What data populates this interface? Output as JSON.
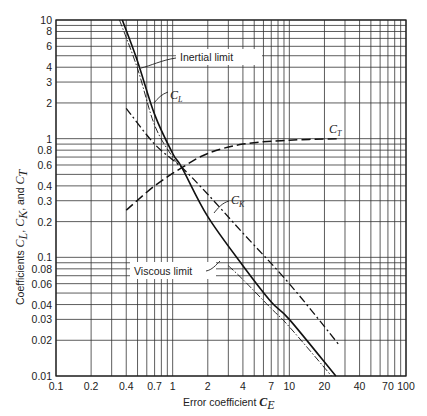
{
  "chart_data": {
    "type": "line",
    "title": "",
    "xlabel": "Error coefficient C_E",
    "ylabel": "Coefficients C_L, C_K, and C_T",
    "xscale": "log",
    "yscale": "log",
    "xlim": [
      0.1,
      100
    ],
    "ylim": [
      0.01,
      10
    ],
    "grid": true,
    "x_ticks": [
      "0.1",
      "0.2",
      "0.4",
      "0.7",
      "1",
      "2",
      "4",
      "7",
      "10",
      "20",
      "40",
      "70",
      "100"
    ],
    "y_ticks": [
      "0.01",
      "0.02",
      "0.03",
      "0.04",
      "0.06",
      "0.08",
      "0.1",
      "0.2",
      "0.3",
      "0.4",
      "0.6",
      "0.8",
      "1",
      "2",
      "3",
      "4",
      "6",
      "8",
      "10"
    ],
    "series": [
      {
        "name": "C_L",
        "style": "solid",
        "x": [
          0.37,
          0.5,
          0.7,
          1.0,
          1.2,
          2,
          4,
          7,
          10,
          25
        ],
        "y": [
          10,
          4.5,
          1.6,
          0.75,
          0.57,
          0.22,
          0.085,
          0.042,
          0.03,
          0.01
        ]
      },
      {
        "name": "Inertial limit",
        "style": "dash-dot-thin",
        "x": [
          0.35,
          0.5,
          0.7,
          1.0,
          1.2
        ],
        "y": [
          10,
          3.9,
          1.3,
          0.7,
          0.57
        ]
      },
      {
        "name": "Viscous limit",
        "style": "dash-dot-thin",
        "x": [
          3.0,
          4,
          7,
          10,
          23
        ],
        "y": [
          0.085,
          0.065,
          0.037,
          0.026,
          0.01
        ]
      },
      {
        "name": "C_K",
        "style": "dash-dot",
        "x": [
          0.4,
          0.7,
          1.2,
          2,
          4,
          10,
          27
        ],
        "y": [
          1.8,
          0.9,
          0.57,
          0.34,
          0.16,
          0.06,
          0.018
        ]
      },
      {
        "name": "C_T",
        "style": "dashed",
        "x": [
          0.4,
          0.7,
          1.2,
          2,
          4,
          10,
          27
        ],
        "y": [
          0.25,
          0.4,
          0.57,
          0.75,
          0.9,
          0.97,
          1.0
        ]
      }
    ],
    "annotations": [
      {
        "text": "Inertial limit"
      },
      {
        "text": "C_L"
      },
      {
        "text": "C_T"
      },
      {
        "text": "C_K"
      },
      {
        "text": "Viscous limit"
      }
    ]
  },
  "labels": {
    "x_axis_main": "Error coefficient ",
    "x_axis_sym": "C",
    "x_axis_sub": "E",
    "y_axis_main": "Coefficients ",
    "y_axis_cl": "C",
    "y_axis_cl_sub": "L",
    "y_axis_sep1": ", ",
    "y_axis_ck": "C",
    "y_axis_ck_sub": "K",
    "y_axis_sep2": ", and ",
    "y_axis_ct": "C",
    "y_axis_ct_sub": "T",
    "inertial": "Inertial limit",
    "viscous": "Viscous limit",
    "cl_sym": "C",
    "cl_sub": "L",
    "ct_sym": "C",
    "ct_sub": "T",
    "ck_sym": "C",
    "ck_sub": "K"
  }
}
